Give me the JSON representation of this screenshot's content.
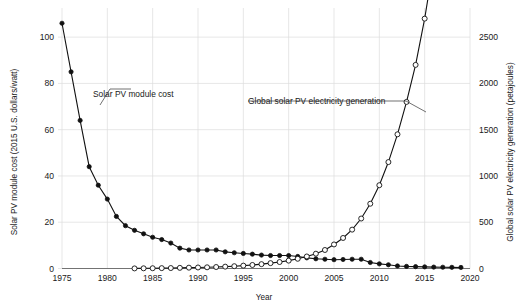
{
  "chart_data": {
    "type": "line",
    "title": "",
    "xlabel": "Year",
    "xlim": [
      1975,
      2020
    ],
    "xticks": [
      1975,
      1980,
      1985,
      1990,
      1995,
      2000,
      2005,
      2010,
      2015,
      2020
    ],
    "xtick_labels": [
      "1975",
      "1980",
      "1985",
      "1990",
      "1995",
      "2000",
      "2005",
      "2010",
      "2015",
      "2020"
    ],
    "grid": "vertical and horizontal light gray gridlines",
    "legend": "none (direct annotations with leader lines)",
    "axes": [
      {
        "side": "left",
        "ylabel": "Solar PV module cost (2015 U.S. dollars/watt)",
        "ylim": [
          0,
          110
        ],
        "yticks": [
          0,
          20,
          40,
          60,
          80,
          100
        ],
        "ytick_labels": [
          "0",
          "20",
          "40",
          "60",
          "80",
          "100"
        ]
      },
      {
        "side": "right",
        "ylabel": "Global solar PV electricity generation (petajoules)",
        "ylim": [
          0,
          2750
        ],
        "yticks": [
          0,
          500,
          1000,
          1500,
          2000,
          2500
        ],
        "ytick_labels": [
          "0",
          "500",
          "1000",
          "1500",
          "2000",
          "2500"
        ]
      }
    ],
    "series": [
      {
        "name": "Solar PV module cost",
        "axis": "left",
        "marker": "filled-circle",
        "color": "#111111",
        "units": "2015 U.S. dollars/watt",
        "x": [
          1975,
          1976,
          1977,
          1978,
          1979,
          1980,
          1981,
          1982,
          1983,
          1984,
          1985,
          1986,
          1987,
          1988,
          1989,
          1990,
          1991,
          1992,
          1993,
          1994,
          1995,
          1996,
          1997,
          1998,
          1999,
          2000,
          2001,
          2002,
          2003,
          2004,
          2005,
          2006,
          2007,
          2008,
          2009,
          2010,
          2011,
          2012,
          2013,
          2014,
          2015,
          2016,
          2017,
          2018,
          2019
        ],
        "values": [
          106,
          85,
          64,
          44,
          36,
          30,
          22.5,
          18.5,
          16.5,
          15,
          13.5,
          12.5,
          11,
          8.8,
          8,
          8,
          8,
          8,
          7.2,
          6.8,
          6.5,
          6.2,
          5.8,
          5.6,
          5.6,
          5.6,
          5.2,
          4.6,
          4.2,
          4,
          3.8,
          3.9,
          4,
          4,
          2.6,
          2,
          1.6,
          1.1,
          0.9,
          0.8,
          0.7,
          0.6,
          0.55,
          0.5,
          0.45
        ]
      },
      {
        "name": "Global solar PV electricity generation",
        "axis": "right",
        "marker": "open-circle",
        "color": "#111111",
        "units": "petajoules",
        "x": [
          1983,
          1984,
          1985,
          1986,
          1987,
          1988,
          1989,
          1990,
          1991,
          1992,
          1993,
          1994,
          1995,
          1996,
          1997,
          1998,
          1999,
          2000,
          2001,
          2002,
          2003,
          2004,
          2005,
          2006,
          2007,
          2008,
          2009,
          2010,
          2011,
          2012,
          2013,
          2014,
          2015,
          2016,
          2017,
          2018,
          2019
        ],
        "values": [
          1,
          2,
          3,
          4,
          5,
          7,
          9,
          11,
          13,
          16,
          20,
          25,
          31,
          38,
          47,
          58,
          70,
          85,
          105,
          130,
          160,
          200,
          260,
          330,
          420,
          540,
          700,
          900,
          1150,
          1450,
          1800,
          2200,
          2700,
          3300,
          4100,
          5000,
          6100
        ]
      }
    ],
    "annotations": [
      {
        "label": "Solar PV module cost",
        "points_to": "left cost series near 1978"
      },
      {
        "label": "Global solar PV electricity generation",
        "points_to": "right generation series near 2017"
      }
    ]
  }
}
